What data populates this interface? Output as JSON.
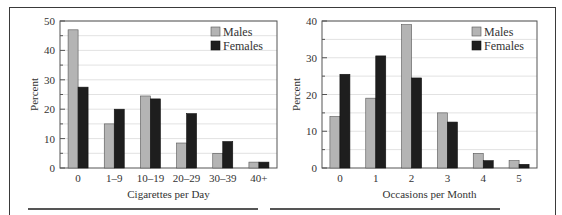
{
  "colors": {
    "males": "#b4b4b4",
    "females": "#1e1e1e",
    "grid": "#e2e2e2",
    "axis": "#555555"
  },
  "chart_data": [
    {
      "type": "bar",
      "title": "",
      "xlabel": "Cigarettes per Day",
      "ylabel": "Percent",
      "ylim": [
        0,
        50
      ],
      "yticks": [
        0,
        10,
        20,
        30,
        40,
        50
      ],
      "grid": true,
      "legend_position": "upper right",
      "categories": [
        "0",
        "1–9",
        "10–19",
        "20–29",
        "30–39",
        "40+"
      ],
      "series": [
        {
          "name": "Males",
          "values": [
            47,
            15,
            24.5,
            8.5,
            5,
            2
          ]
        },
        {
          "name": "Females",
          "values": [
            27.5,
            20,
            23.5,
            18.5,
            9,
            2
          ]
        }
      ]
    },
    {
      "type": "bar",
      "title": "",
      "xlabel": "Occasions per Month",
      "ylabel": "Percent",
      "ylim": [
        0,
        40
      ],
      "yticks": [
        0,
        10,
        20,
        30,
        40
      ],
      "grid": true,
      "legend_position": "upper right",
      "categories": [
        "0",
        "1",
        "2",
        "3",
        "4",
        "5"
      ],
      "series": [
        {
          "name": "Males",
          "values": [
            14,
            19,
            39,
            15,
            4,
            2
          ]
        },
        {
          "name": "Females",
          "values": [
            25.5,
            30.5,
            24.5,
            12.5,
            2,
            1
          ]
        }
      ]
    }
  ],
  "legend": {
    "males_label": "Males",
    "females_label": "Females"
  }
}
